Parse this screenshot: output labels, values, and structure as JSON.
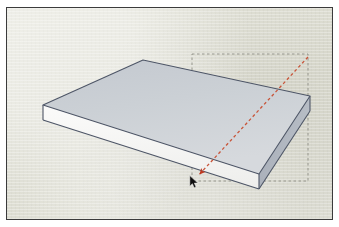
{
  "app": {
    "name": "SketchUp",
    "scene_title": "3D Rectangular Slab Model",
    "tool": "Move Tool",
    "view_mode": "Isometric Perspective"
  },
  "viewport": {
    "label": "modeling-viewport",
    "width": 327,
    "height": 213,
    "background_color": "#dfdfd4",
    "frame_color": "#3b3b3b"
  },
  "model": {
    "name": "rectangular-slab",
    "description": "Thin rectangular box drawn in isometric view",
    "faces": {
      "top": {
        "name": "top-face",
        "fill_start": "#c6cbd2",
        "fill_end": "#d4d8dc",
        "points": "136,52 36,97 252,166 303,88"
      },
      "front_left": {
        "name": "front-left-face",
        "fill": "#f6f6f4",
        "points": "36,97 36,112 252,181 252,166"
      },
      "right_side": {
        "name": "right-side-face",
        "fill": "#aab0ba",
        "points": "252,166 252,181 303,103 303,88"
      }
    },
    "edge_color": "#4d5566",
    "edge_width": 1.1
  },
  "selection_box": {
    "name": "selection-bounding-box",
    "stroke": "#8e8e86",
    "dash": "2.5 2.5",
    "x": 185,
    "y": 46,
    "width": 116,
    "height": 127
  },
  "inference_line": {
    "name": "inference-guide-line",
    "color": "#c8553a",
    "dash": "3 2.6",
    "width": 1.3,
    "x1": 301,
    "y1": 49,
    "x2": 189,
    "y2": 170,
    "arrow_color": "#bf3a22",
    "tooltip": ""
  },
  "cursor": {
    "name": "mouse-pointer",
    "x": 182,
    "y": 167,
    "color": "#101010"
  },
  "chart_data": {
    "type": "table",
    "categories": [
      "top-apex",
      "left-corner",
      "bottom-corner",
      "right-corner"
    ],
    "values": [
      52,
      97,
      172,
      88
    ],
    "xlabel": "vertex",
    "ylabel": "screen-y (px)"
  }
}
